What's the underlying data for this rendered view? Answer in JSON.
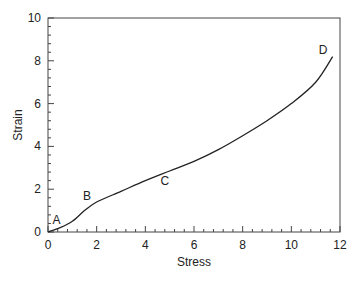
{
  "chart_data": {
    "type": "line",
    "title": "",
    "xlabel": "Stress",
    "ylabel": "Strain",
    "xlim": [
      0,
      12
    ],
    "ylim": [
      0,
      10
    ],
    "x_ticks": [
      0,
      2,
      4,
      6,
      8,
      10,
      12
    ],
    "y_ticks": [
      0,
      2,
      4,
      6,
      8,
      10
    ],
    "x_tick_labels": [
      "0",
      "2",
      "4",
      "6",
      "8",
      "10",
      "12"
    ],
    "y_tick_labels": [
      "0",
      "2",
      "4",
      "6",
      "8",
      "10"
    ],
    "grid": false,
    "legend": null,
    "series": [
      {
        "name": "stress-strain curve",
        "x": [
          0,
          0.5,
          1.0,
          1.5,
          2.0,
          3.0,
          4.0,
          5.0,
          6.0,
          7.0,
          8.0,
          9.0,
          10.0,
          11.0,
          11.7
        ],
        "y": [
          0,
          0.2,
          0.5,
          1.0,
          1.4,
          1.9,
          2.4,
          2.85,
          3.3,
          3.85,
          4.5,
          5.2,
          6.0,
          7.0,
          8.2
        ]
      }
    ],
    "annotations": [
      {
        "text": "A",
        "x": 0.35,
        "y": 0.55
      },
      {
        "text": "B",
        "x": 1.6,
        "y": 1.7
      },
      {
        "text": "C",
        "x": 4.8,
        "y": 2.4
      },
      {
        "text": "D",
        "x": 11.3,
        "y": 8.5
      }
    ]
  },
  "colors": {
    "line": "#222222",
    "axis": "#444444",
    "background": "#ffffff"
  }
}
